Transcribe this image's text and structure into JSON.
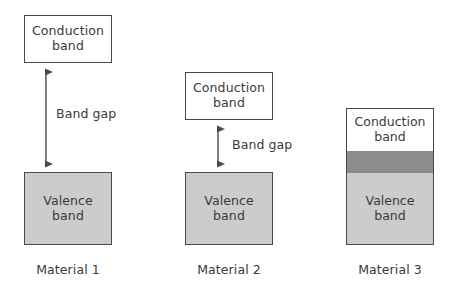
{
  "diagram": {
    "background_color": "#ffffff",
    "stroke_color": "#4a4a4a",
    "text_color": "#3a3a3a",
    "conduction_fill": "#ffffff",
    "valence_fill": "#cccccc",
    "overlap_fill": "#8c8c8c"
  },
  "labels": {
    "conduction_line1": "Conduction",
    "conduction_line2": "band",
    "valence_line1": "Valence",
    "valence_line2": "band",
    "band_gap": "Band gap"
  },
  "materials": [
    {
      "caption": "Material 1",
      "conduction_line1": "Conduction",
      "conduction_line2": "band",
      "valence_line1": "Valence",
      "valence_line2": "band",
      "gap_label": "Band gap",
      "gap_size": "large",
      "has_gap_arrow": true,
      "bands_overlap": false
    },
    {
      "caption": "Material 2",
      "conduction_line1": "Conduction",
      "conduction_line2": "band",
      "valence_line1": "Valence",
      "valence_line2": "band",
      "gap_label": "Band gap",
      "gap_size": "small",
      "has_gap_arrow": true,
      "bands_overlap": false
    },
    {
      "caption": "Material 3",
      "conduction_line1": "Conduction",
      "conduction_line2": "band",
      "valence_line1": "Valence",
      "valence_line2": "band",
      "gap_label": "",
      "gap_size": "none",
      "has_gap_arrow": false,
      "bands_overlap": true
    }
  ]
}
